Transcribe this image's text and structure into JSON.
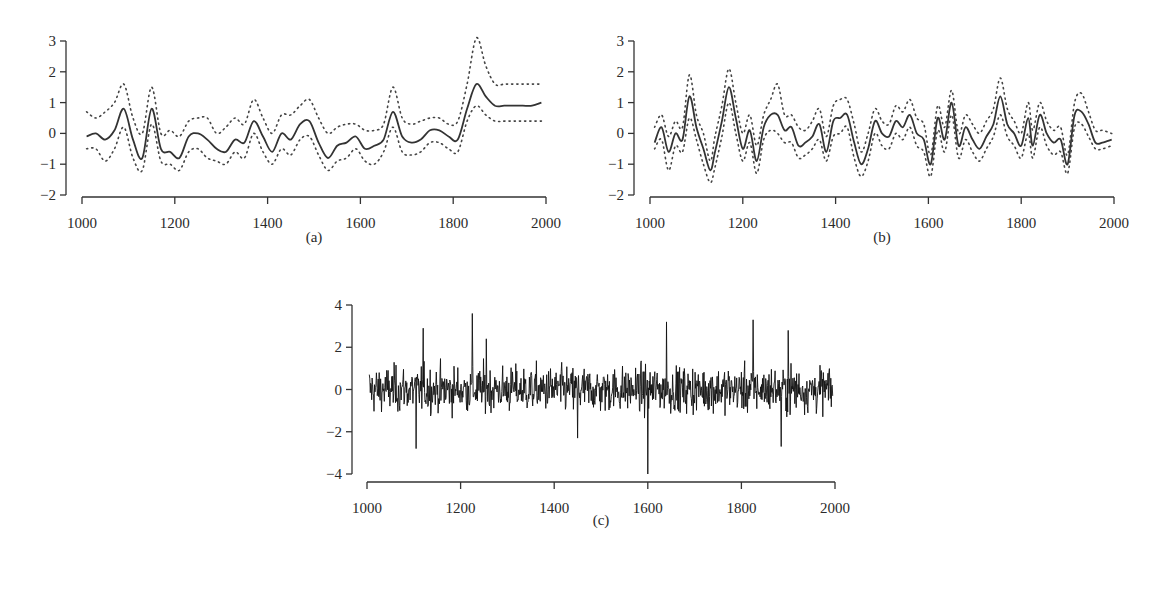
{
  "chart_data": [
    {
      "id": "a",
      "type": "line",
      "panel_label": "(a)",
      "title": "",
      "xlabel": "",
      "ylabel": "",
      "xlim": [
        1000,
        2000
      ],
      "ylim": [
        -2,
        3
      ],
      "xticks": [
        1000,
        1200,
        1400,
        1600,
        1800,
        2000
      ],
      "yticks": [
        3,
        2,
        1,
        0,
        -1,
        -2
      ],
      "grid": false,
      "legend": null,
      "x": [
        1010,
        1030,
        1050,
        1070,
        1090,
        1110,
        1130,
        1150,
        1170,
        1190,
        1210,
        1230,
        1250,
        1270,
        1290,
        1310,
        1330,
        1350,
        1370,
        1390,
        1410,
        1430,
        1450,
        1470,
        1490,
        1510,
        1530,
        1550,
        1570,
        1590,
        1610,
        1630,
        1650,
        1670,
        1690,
        1710,
        1730,
        1750,
        1770,
        1790,
        1810,
        1830,
        1850,
        1870,
        1890,
        1910,
        1930,
        1950,
        1970,
        1990
      ],
      "series": [
        {
          "name": "estimate",
          "style": "solid",
          "values": [
            -0.1,
            0.0,
            -0.2,
            0.1,
            0.8,
            -0.2,
            -0.8,
            0.8,
            -0.5,
            -0.6,
            -0.8,
            -0.1,
            0.0,
            -0.2,
            -0.5,
            -0.6,
            -0.2,
            -0.3,
            0.4,
            -0.1,
            -0.6,
            0.0,
            -0.2,
            0.3,
            0.4,
            -0.3,
            -0.8,
            -0.4,
            -0.3,
            -0.1,
            -0.5,
            -0.4,
            -0.2,
            0.7,
            -0.1,
            -0.3,
            -0.2,
            0.1,
            0.1,
            -0.1,
            -0.2,
            0.8,
            1.6,
            1.2,
            0.9,
            0.9,
            0.9,
            0.9,
            0.9,
            1.0
          ]
        },
        {
          "name": "upper bound",
          "style": "dotted",
          "values": [
            0.7,
            0.5,
            0.7,
            1.0,
            1.6,
            0.5,
            0.0,
            1.5,
            0.0,
            0.1,
            -0.1,
            0.4,
            0.5,
            0.5,
            0.0,
            0.2,
            0.5,
            0.3,
            1.1,
            0.5,
            0.0,
            0.6,
            0.6,
            0.9,
            1.1,
            0.5,
            0.0,
            0.2,
            0.3,
            0.3,
            0.1,
            0.1,
            0.3,
            1.5,
            0.5,
            0.3,
            0.4,
            0.5,
            0.5,
            0.3,
            0.4,
            1.6,
            3.1,
            2.2,
            1.6,
            1.6,
            1.6,
            1.6,
            1.6,
            1.6
          ]
        },
        {
          "name": "lower bound",
          "style": "dotted",
          "values": [
            -0.5,
            -0.5,
            -0.9,
            -0.5,
            0.2,
            -0.8,
            -1.2,
            0.3,
            -0.9,
            -1.0,
            -1.2,
            -0.6,
            -0.5,
            -0.8,
            -0.9,
            -1.0,
            -0.6,
            -0.8,
            0.0,
            -0.6,
            -1.0,
            -0.5,
            -0.7,
            -0.2,
            -0.1,
            -0.7,
            -1.2,
            -0.9,
            -0.8,
            -0.5,
            -0.9,
            -1.0,
            -0.6,
            0.2,
            -0.6,
            -0.7,
            -0.6,
            -0.3,
            -0.3,
            -0.5,
            -0.6,
            0.4,
            0.9,
            0.6,
            0.4,
            0.4,
            0.4,
            0.4,
            0.4,
            0.4
          ]
        }
      ]
    },
    {
      "id": "b",
      "type": "line",
      "panel_label": "(b)",
      "title": "",
      "xlabel": "",
      "ylabel": "",
      "xlim": [
        1000,
        2000
      ],
      "ylim": [
        -2,
        3
      ],
      "xticks": [
        1000,
        1200,
        1400,
        1600,
        1800,
        2000
      ],
      "yticks": [
        3,
        2,
        1,
        0,
        -1,
        -2
      ],
      "grid": false,
      "legend": null,
      "x": [
        1010,
        1025,
        1040,
        1055,
        1070,
        1085,
        1100,
        1115,
        1130,
        1140,
        1155,
        1170,
        1185,
        1200,
        1215,
        1230,
        1245,
        1260,
        1275,
        1290,
        1305,
        1320,
        1335,
        1350,
        1365,
        1380,
        1395,
        1410,
        1425,
        1440,
        1455,
        1470,
        1485,
        1500,
        1515,
        1530,
        1545,
        1560,
        1575,
        1590,
        1605,
        1620,
        1635,
        1650,
        1665,
        1680,
        1695,
        1710,
        1725,
        1740,
        1755,
        1770,
        1785,
        1800,
        1815,
        1825,
        1840,
        1855,
        1870,
        1885,
        1900,
        1915,
        1930,
        1945,
        1960,
        1975,
        1995
      ],
      "series": [
        {
          "name": "estimate",
          "style": "solid",
          "values": [
            -0.3,
            0.2,
            -0.6,
            0.0,
            -0.2,
            1.2,
            0.2,
            -0.5,
            -1.2,
            -0.6,
            0.4,
            1.5,
            0.5,
            -0.5,
            0.1,
            -0.9,
            0.2,
            0.6,
            0.6,
            0.1,
            0.2,
            -0.4,
            -0.3,
            -0.1,
            0.3,
            -0.6,
            0.4,
            0.5,
            0.6,
            -0.3,
            -1.0,
            -0.5,
            0.4,
            0.0,
            -0.1,
            0.4,
            0.2,
            0.6,
            0.0,
            -0.2,
            -1.0,
            0.5,
            -0.2,
            1.0,
            -0.4,
            0.2,
            -0.2,
            -0.5,
            -0.1,
            0.3,
            1.2,
            0.3,
            0.0,
            -0.4,
            0.5,
            -0.4,
            0.6,
            0.0,
            -0.3,
            -0.2,
            -1.0,
            0.6,
            0.7,
            0.3,
            -0.3,
            -0.3,
            -0.2
          ]
        },
        {
          "name": "upper bound",
          "style": "dotted",
          "values": [
            0.2,
            0.6,
            -0.1,
            0.4,
            0.2,
            1.9,
            0.6,
            0.0,
            -0.9,
            -0.1,
            0.9,
            2.1,
            1.0,
            0.0,
            0.6,
            -0.4,
            0.6,
            1.1,
            1.6,
            0.6,
            0.6,
            0.2,
            0.1,
            0.4,
            0.8,
            -0.1,
            0.9,
            1.1,
            1.1,
            0.3,
            -0.6,
            0.0,
            0.8,
            0.4,
            0.3,
            0.9,
            0.7,
            1.1,
            0.5,
            0.3,
            -0.7,
            0.9,
            0.2,
            1.4,
            0.0,
            0.6,
            0.3,
            0.0,
            0.4,
            0.8,
            1.8,
            0.8,
            0.4,
            0.0,
            1.0,
            0.1,
            1.0,
            0.4,
            0.1,
            0.2,
            -0.7,
            1.0,
            1.3,
            0.7,
            0.1,
            0.1,
            0.0
          ]
        },
        {
          "name": "lower bound",
          "style": "dotted",
          "values": [
            -0.5,
            -0.2,
            -1.2,
            -0.4,
            -0.6,
            0.5,
            -0.2,
            -1.0,
            -1.6,
            -1.1,
            -0.1,
            1.0,
            0.0,
            -0.9,
            -0.3,
            -1.3,
            -0.2,
            0.1,
            0.0,
            -0.3,
            -0.3,
            -0.8,
            -0.7,
            -0.5,
            -0.2,
            -0.9,
            -0.1,
            0.0,
            0.2,
            -0.8,
            -1.4,
            -0.9,
            0.0,
            -0.4,
            -0.5,
            0.0,
            -0.2,
            0.2,
            -0.4,
            -0.6,
            -1.4,
            0.1,
            -0.6,
            0.6,
            -0.8,
            -0.2,
            -0.6,
            -0.9,
            -0.5,
            -0.1,
            0.6,
            -0.1,
            -0.4,
            -0.8,
            0.0,
            -0.8,
            0.2,
            -0.4,
            -0.7,
            -0.6,
            -1.3,
            0.2,
            0.3,
            -0.1,
            -0.5,
            -0.5,
            -0.4
          ]
        }
      ]
    },
    {
      "id": "c",
      "type": "line",
      "panel_label": "(c)",
      "title": "",
      "xlabel": "",
      "ylabel": "",
      "xlim": [
        1000,
        2000
      ],
      "ylim": [
        -4,
        4
      ],
      "xticks": [
        1000,
        1200,
        1400,
        1600,
        1800,
        2000
      ],
      "yticks": [
        4,
        2,
        0,
        -2,
        -4
      ],
      "grid": false,
      "legend": null,
      "description": "Annual high-frequency noise series (one value per year 1000–2000), fluctuating roughly within ±2 with occasional spikes.",
      "notable_points": [
        {
          "x": 1105,
          "y": -2.8
        },
        {
          "x": 1120,
          "y": 2.9
        },
        {
          "x": 1225,
          "y": 3.6
        },
        {
          "x": 1255,
          "y": 2.4
        },
        {
          "x": 1450,
          "y": -2.3
        },
        {
          "x": 1600,
          "y": -4.0
        },
        {
          "x": 1640,
          "y": 3.2
        },
        {
          "x": 1825,
          "y": 3.3
        },
        {
          "x": 1885,
          "y": -2.7
        },
        {
          "x": 1900,
          "y": 2.8
        }
      ],
      "typical_range": [
        -1.8,
        1.8
      ]
    }
  ],
  "panels": {
    "a": {
      "label": "(a)"
    },
    "b": {
      "label": "(b)"
    },
    "c": {
      "label": "(c)"
    }
  }
}
